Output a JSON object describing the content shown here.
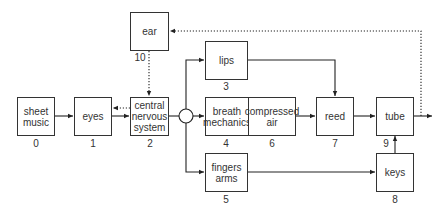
{
  "diagram": {
    "type": "block-diagram",
    "blocks": [
      {
        "id": "0",
        "label": "sheet\nmusic",
        "number": "0"
      },
      {
        "id": "1",
        "label": "eyes",
        "number": "1"
      },
      {
        "id": "2",
        "label": "central\nnervous\nsystem",
        "number": "2"
      },
      {
        "id": "3",
        "label": "lips",
        "number": "3"
      },
      {
        "id": "4",
        "label": "breath\nmechanics",
        "number": "4"
      },
      {
        "id": "5",
        "label": "fingers\narms",
        "number": "5"
      },
      {
        "id": "6",
        "label": "compressed\nair",
        "number": "6"
      },
      {
        "id": "7",
        "label": "reed",
        "number": "7"
      },
      {
        "id": "8",
        "label": "keys",
        "number": "8"
      },
      {
        "id": "9",
        "label": "tube",
        "number": "9"
      },
      {
        "id": "10",
        "label": "ear",
        "number": "10"
      }
    ],
    "edges": [
      {
        "from": "0",
        "to": "1",
        "style": "solid"
      },
      {
        "from": "1",
        "to": "2",
        "style": "solid"
      },
      {
        "from": "2",
        "to": "1",
        "style": "dotted"
      },
      {
        "from": "10",
        "to": "2",
        "style": "dotted"
      },
      {
        "from": "2",
        "to": "junction",
        "style": "solid"
      },
      {
        "from": "junction",
        "to": "3",
        "style": "solid"
      },
      {
        "from": "junction",
        "to": "4",
        "style": "solid"
      },
      {
        "from": "junction",
        "to": "5",
        "style": "solid"
      },
      {
        "from": "3",
        "to": "7",
        "style": "solid"
      },
      {
        "from": "6",
        "to": "7",
        "style": "solid"
      },
      {
        "from": "7",
        "to": "9",
        "style": "solid"
      },
      {
        "from": "5",
        "to": "8",
        "style": "solid"
      },
      {
        "from": "8",
        "to": "9",
        "style": "solid"
      },
      {
        "from": "9",
        "to": "output",
        "style": "solid"
      },
      {
        "from": "9",
        "to": "10",
        "style": "dotted"
      }
    ]
  }
}
